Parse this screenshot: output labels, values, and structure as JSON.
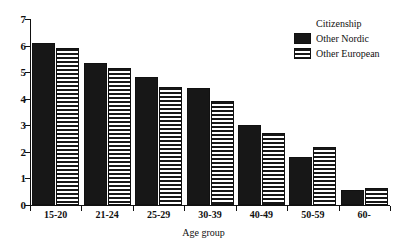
{
  "chart_data": {
    "type": "bar",
    "title": "",
    "clipped_top_text": "",
    "xlabel": "Age group",
    "ylabel": "",
    "categories": [
      "15-20",
      "21-24",
      "25-29",
      "30-39",
      "40-49",
      "50-59",
      "60-"
    ],
    "series": [
      {
        "name": "Other Nordic",
        "pattern": "solid",
        "color": "#171717",
        "values": [
          6.1,
          5.35,
          4.8,
          4.4,
          3.0,
          1.8,
          0.55
        ]
      },
      {
        "name": "Other European",
        "pattern": "striped",
        "color": "#171717",
        "values": [
          5.9,
          5.15,
          4.45,
          3.9,
          2.7,
          2.2,
          0.65
        ]
      }
    ],
    "ylim": [
      0,
      7
    ],
    "yticks": [
      0,
      1,
      2,
      3,
      4,
      5,
      6,
      7
    ],
    "ytick_labels": [
      "0",
      "1",
      "2",
      "3",
      "4",
      "5",
      "6",
      "7"
    ],
    "grid": false,
    "legend": {
      "title": "Citizenship",
      "position": "top-right",
      "entries": [
        "Other Nordic",
        "Other European"
      ]
    }
  }
}
